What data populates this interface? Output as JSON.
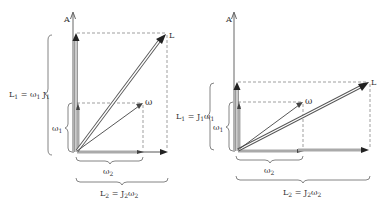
{
  "figure": {
    "panels": [
      {
        "id": "left",
        "axis_label": "A",
        "vector_L_label": "L",
        "vector_omega_label": "ω",
        "brace_vertical_large": {
          "main": "L",
          "sub1": "1",
          "eq": " = ω",
          "sub2": "1",
          "tail": " J",
          "sub3": "1"
        },
        "brace_vertical_small": {
          "main": "ω",
          "sub": "1"
        },
        "brace_horizontal_small": {
          "main": "ω",
          "sub": "2"
        },
        "brace_horizontal_large": {
          "main": "L",
          "sub1": "2",
          "eq": " = J",
          "sub2": "2",
          "tail": "ω",
          "sub3": "2"
        }
      },
      {
        "id": "right",
        "axis_label": "A",
        "vector_L_label": "L",
        "vector_omega_label": "ω",
        "brace_vertical_large": {
          "main": "L",
          "sub1": "1",
          "eq": " = J",
          "sub2": "1",
          "tail": "ω",
          "sub3": "1"
        },
        "brace_vertical_small": {
          "main": "ω",
          "sub": "1"
        },
        "brace_horizontal_small": {
          "main": "ω",
          "sub": "2"
        },
        "brace_horizontal_large": {
          "main": "L",
          "sub1": "2",
          "eq": " = J",
          "sub2": "2",
          "tail": "ω",
          "sub3": "2"
        }
      }
    ],
    "colors": {
      "ink": "#333333",
      "dash": "#777777",
      "fill_arrow": "#222222",
      "bar": "#aaaaaa"
    }
  }
}
